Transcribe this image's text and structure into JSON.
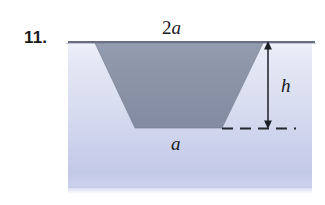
{
  "figure": {
    "problem_number": "11.",
    "labels": {
      "top_width_coefficient": "2",
      "top_width_variable": "a",
      "height": "h",
      "bottom_width": "a"
    },
    "colors": {
      "trough_fill": "#8b93a7",
      "trough_outline": "#6f footnote",
      "medium_top": "#eef0f9",
      "medium_bottom": "#c2c9e7",
      "surface_line": "#5b6378",
      "annotation": "#1a1a1a",
      "problem_number": "#1a1a1a"
    },
    "geometry": {
      "medium_block": {
        "x": 68,
        "y": 41,
        "width": 244,
        "height": 147
      },
      "trapezoid": {
        "top_left_x": 95,
        "top_right_x": 263,
        "top_y": 43,
        "bottom_left_x": 135,
        "bottom_right_x": 222,
        "bottom_y": 128
      },
      "dimension_arrow": {
        "x": 268,
        "y_top": 42,
        "y_bottom": 128
      },
      "dashed_baseline": {
        "y": 128,
        "x_start": 222,
        "x_end": 296
      }
    }
  }
}
